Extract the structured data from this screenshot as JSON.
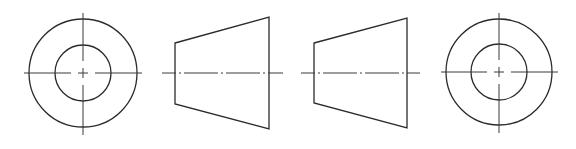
{
  "drawing": {
    "title": "",
    "background": "#ffffff",
    "line_color": "#2b2b2b",
    "centerline_color": "#3a3a3a",
    "views": [
      {
        "name": "left-end-view",
        "type": "concentric-circles",
        "center": [
          83,
          73
        ],
        "outer_radius": 54,
        "inner_radius": 28,
        "h_centerline": [
          24,
          142
        ],
        "v_centerline": [
          13,
          135
        ]
      },
      {
        "name": "front-view-1",
        "type": "trapezoid",
        "points": [
          [
            175,
            43
          ],
          [
            269,
            17
          ],
          [
            269,
            129
          ],
          [
            175,
            104
          ]
        ],
        "centerline": {
          "y": 73,
          "x1": 162,
          "x2": 283
        }
      },
      {
        "name": "front-view-2",
        "type": "trapezoid",
        "points": [
          [
            314,
            43
          ],
          [
            407,
            18
          ],
          [
            407,
            128
          ],
          [
            314,
            103
          ]
        ],
        "centerline": {
          "y": 73,
          "x1": 301,
          "x2": 420
        }
      },
      {
        "name": "right-end-view",
        "type": "concentric-circles",
        "center": [
          499,
          72
        ],
        "outer_radius": 53,
        "inner_radius": 28,
        "h_centerline": [
          441,
          558
        ],
        "v_centerline": [
          13,
          133
        ]
      }
    ]
  }
}
